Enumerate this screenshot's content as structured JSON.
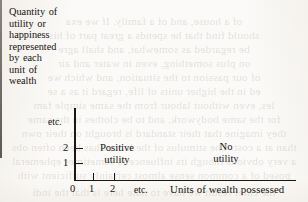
{
  "figure": {
    "y_axis_caption_lines": [
      "Quantity of",
      "utility or",
      "happiness",
      "represented",
      "by each",
      "unit of",
      "wealth"
    ],
    "x_axis_title": "Units of wealth possessed",
    "y_ticks": [
      {
        "label": "1"
      },
      {
        "label": "2"
      },
      {
        "label": "etc."
      }
    ],
    "x_ticks": [
      {
        "label": "0"
      },
      {
        "label": "1"
      },
      {
        "label": "2"
      },
      {
        "label": "etc."
      }
    ],
    "regions": [
      {
        "name": "positive",
        "line1": "Positive",
        "line2": "utility"
      },
      {
        "name": "none",
        "line1": "No",
        "line2": "utility"
      }
    ],
    "colors": {
      "ink": "#15120e",
      "rule": "#1b1713",
      "paper": "#fbfaf8",
      "bleed_through": "#786e62"
    }
  },
  "chart_data": {
    "type": "bar",
    "title": "",
    "xlabel": "Units of wealth possessed",
    "ylabel": "Quantity of utility or happiness represented by each unit of wealth",
    "categories": [
      "0",
      "1",
      "2",
      "etc."
    ],
    "values": [
      2,
      2,
      2,
      0
    ],
    "ylim": [
      0,
      3
    ],
    "xlim": [
      0,
      10
    ],
    "grid": false,
    "legend": null,
    "annotations": [
      {
        "text": "Positive utility",
        "region": "left-of-divider"
      },
      {
        "text": "No utility",
        "region": "right-of-divider"
      },
      {
        "text": "etc.",
        "axis": "y",
        "position": "above-tick-2"
      },
      {
        "text": "etc.",
        "axis": "x",
        "position": "right-of-tick-2"
      }
    ],
    "divider": {
      "orientation": "vertical",
      "description": "vertical boundary separating positive utility from no utility"
    }
  },
  "background_bleed_lines": [
    "",
    "of a house, and of a family. If we exa",
    "should find that he spends a great part of his",
    "be regarded as somewhat, and shall agre",
    "on plus something, even in water and air",
    "of our passion to the situation, and which we",
    "ed in the higher units of life, regard it as a se",
    "les, even without labour from the same simple fam",
    "for the same bodywork, and to be clothes in the same",
    "they imagine that their standard is brought on their own",
    "than at a cost.     The stimulus of the labour has been often obs",
    "a very obvious though its influence is sometimes ephemeral",
    "posed of a common sense almost certainly sufficient with",
    "the chief result we have to note here is that the indi",
    ""
  ]
}
